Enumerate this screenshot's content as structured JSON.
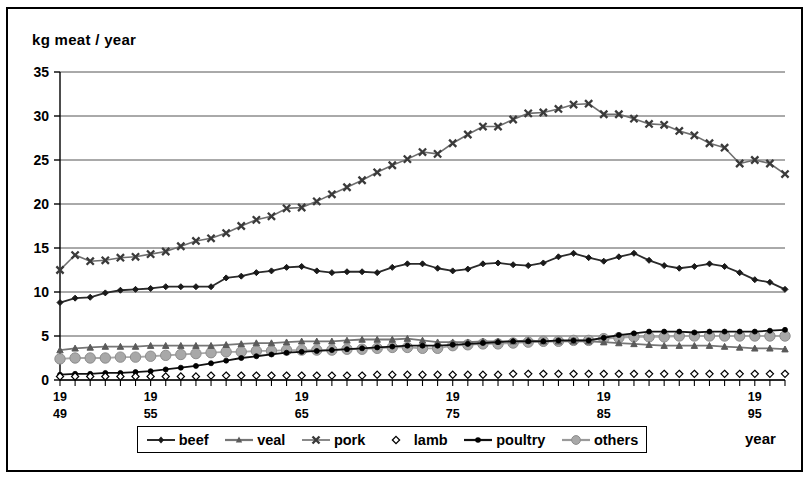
{
  "axis_title_y": "kg meat / year",
  "axis_title_x": "year",
  "legend": {
    "items": [
      {
        "label": "beef",
        "key": "line-diamond-dark",
        "color": "#2b2b2b"
      },
      {
        "label": "veal",
        "key": "line-triangle-gray",
        "color": "#767676"
      },
      {
        "label": "pork",
        "key": "line-cross-gray",
        "color": "#6e6e6e"
      },
      {
        "label": "lamb",
        "key": "open-diamond",
        "color": "#000000"
      },
      {
        "label": "poultry",
        "key": "line-dot-black",
        "color": "#111111"
      },
      {
        "label": "others",
        "key": "line-bigcircle-gray",
        "color": "#a8a8a8"
      }
    ]
  },
  "chart_data": {
    "type": "line",
    "title": "",
    "xlabel": "year",
    "ylabel": "kg meat / year",
    "xlim": [
      1949,
      1997
    ],
    "ylim": [
      0,
      35
    ],
    "yticks": [
      0,
      5,
      10,
      15,
      20,
      25,
      30,
      35
    ],
    "xticks": [
      1949,
      1955,
      1965,
      1975,
      1985,
      1995
    ],
    "xtick_labels_line1": [
      "19",
      "19",
      "19",
      "19",
      "19",
      "19"
    ],
    "xtick_labels_line2": [
      "49",
      "55",
      "65",
      "75",
      "85",
      "95"
    ],
    "grid": "horizontal",
    "legend_position": "bottom",
    "x": [
      1949,
      1950,
      1951,
      1952,
      1953,
      1954,
      1955,
      1956,
      1957,
      1958,
      1959,
      1960,
      1961,
      1962,
      1963,
      1964,
      1965,
      1966,
      1967,
      1968,
      1969,
      1970,
      1971,
      1972,
      1973,
      1974,
      1975,
      1976,
      1977,
      1978,
      1979,
      1980,
      1981,
      1982,
      1983,
      1984,
      1985,
      1986,
      1987,
      1988,
      1989,
      1990,
      1991,
      1992,
      1993,
      1994,
      1995,
      1996,
      1997
    ],
    "series": [
      {
        "name": "pork",
        "marker": "cross",
        "values": [
          12.5,
          14.2,
          13.5,
          13.6,
          13.9,
          14.0,
          14.3,
          14.6,
          15.2,
          15.8,
          16.1,
          16.7,
          17.5,
          18.2,
          18.6,
          19.5,
          19.6,
          20.3,
          21.1,
          21.9,
          22.7,
          23.6,
          24.4,
          25.1,
          25.9,
          25.7,
          26.9,
          27.9,
          28.8,
          28.8,
          29.6,
          30.3,
          30.4,
          30.8,
          31.3,
          31.4,
          30.2,
          30.2,
          29.7,
          29.1,
          29.0,
          28.3,
          27.8,
          26.9,
          26.4,
          24.6,
          25.0,
          24.6,
          23.4
        ]
      },
      {
        "name": "beef",
        "marker": "diamond",
        "values": [
          8.8,
          9.3,
          9.4,
          9.9,
          10.2,
          10.3,
          10.4,
          10.6,
          10.6,
          10.6,
          10.6,
          11.6,
          11.8,
          12.2,
          12.4,
          12.8,
          12.9,
          12.4,
          12.2,
          12.3,
          12.3,
          12.2,
          12.8,
          13.2,
          13.2,
          12.7,
          12.4,
          12.6,
          13.2,
          13.3,
          13.1,
          13.0,
          13.3,
          14.0,
          14.4,
          13.9,
          13.5,
          14.0,
          14.4,
          13.6,
          13.0,
          12.7,
          12.9,
          13.2,
          12.9,
          12.2,
          11.4,
          11.1,
          10.3
        ]
      },
      {
        "name": "veal",
        "marker": "triangle",
        "values": [
          3.4,
          3.6,
          3.7,
          3.8,
          3.8,
          3.8,
          3.9,
          3.9,
          3.9,
          3.9,
          3.9,
          4.0,
          4.1,
          4.2,
          4.2,
          4.3,
          4.4,
          4.4,
          4.4,
          4.5,
          4.6,
          4.6,
          4.6,
          4.7,
          4.5,
          4.3,
          4.3,
          4.3,
          4.4,
          4.4,
          4.4,
          4.5,
          4.4,
          4.4,
          4.4,
          4.4,
          4.3,
          4.2,
          4.1,
          4.0,
          3.9,
          3.9,
          3.9,
          3.9,
          3.8,
          3.7,
          3.6,
          3.6,
          3.5
        ]
      },
      {
        "name": "others",
        "marker": "bigcircle",
        "values": [
          2.4,
          2.5,
          2.5,
          2.5,
          2.6,
          2.6,
          2.7,
          2.8,
          2.9,
          3.0,
          3.1,
          3.2,
          3.2,
          3.3,
          3.3,
          3.4,
          3.4,
          3.4,
          3.4,
          3.5,
          3.5,
          3.6,
          3.7,
          3.7,
          3.6,
          3.6,
          3.9,
          4.0,
          4.1,
          4.1,
          4.2,
          4.3,
          4.4,
          4.4,
          4.5,
          4.5,
          4.7,
          4.8,
          4.9,
          4.9,
          4.9,
          5.0,
          5.0,
          5.0,
          5.0,
          5.0,
          5.0,
          5.0,
          5.0
        ]
      },
      {
        "name": "poultry",
        "marker": "dot",
        "values": [
          0.6,
          0.7,
          0.7,
          0.8,
          0.8,
          0.9,
          1.0,
          1.2,
          1.4,
          1.6,
          1.9,
          2.2,
          2.5,
          2.7,
          2.9,
          3.1,
          3.2,
          3.3,
          3.4,
          3.5,
          3.6,
          3.7,
          3.8,
          3.9,
          3.9,
          3.9,
          4.0,
          4.1,
          4.2,
          4.3,
          4.4,
          4.4,
          4.4,
          4.5,
          4.5,
          4.5,
          4.8,
          5.1,
          5.3,
          5.5,
          5.5,
          5.5,
          5.4,
          5.5,
          5.5,
          5.5,
          5.5,
          5.6,
          5.7
        ]
      },
      {
        "name": "lamb",
        "marker": "open-diamond",
        "values": [
          0.4,
          0.4,
          0.4,
          0.4,
          0.4,
          0.4,
          0.4,
          0.4,
          0.4,
          0.4,
          0.5,
          0.5,
          0.5,
          0.5,
          0.5,
          0.5,
          0.5,
          0.5,
          0.5,
          0.5,
          0.5,
          0.6,
          0.6,
          0.6,
          0.6,
          0.6,
          0.6,
          0.6,
          0.6,
          0.6,
          0.7,
          0.7,
          0.7,
          0.7,
          0.7,
          0.7,
          0.7,
          0.7,
          0.7,
          0.7,
          0.7,
          0.7,
          0.7,
          0.7,
          0.7,
          0.7,
          0.7,
          0.7,
          0.7
        ]
      }
    ]
  }
}
